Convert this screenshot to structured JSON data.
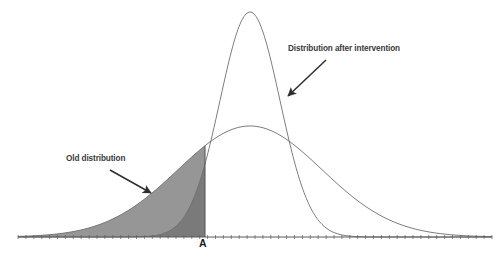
{
  "figure": {
    "width": 503,
    "height": 261,
    "background": "#ffffff"
  },
  "annotations": {
    "after_intervention_label": "Distribution after intervention",
    "old_distribution_label": "Old distribution",
    "threshold_tick_label": "A"
  },
  "colors": {
    "curve_stroke": "#6e6e6e",
    "axis_line": "#5c5c5c",
    "old_fill": "#969696",
    "overlap_fill": "#7a7a7a",
    "arrow": "#2f2f2f",
    "text": "#3a3a3a",
    "tick_label_text": "#1c1c1c"
  },
  "chart_data": {
    "type": "line",
    "title": "",
    "subtitle": "",
    "xlabel": "",
    "ylabel": "",
    "grid": false,
    "legend_position": "annotations",
    "axis": {
      "baseline_y_px": 237,
      "x_start_px": 18,
      "x_end_px": 492,
      "tick_count": 60,
      "tick_labels": [
        "A"
      ],
      "tick_label_positions_px": [
        205
      ],
      "y_axis_shown": false
    },
    "threshold": {
      "label": "A",
      "x_px": 205,
      "line_from_y_px": 147,
      "line_to_y_px": 237,
      "description": "vertical cut marking threshold A"
    },
    "series": [
      {
        "name": "Old distribution",
        "curve": "gaussian",
        "mean_px": 250,
        "sigma_px": 72,
        "peak_y_px": 126,
        "baseline_y_px": 237,
        "amplitude_px": 111,
        "stroke": "#6e6e6e",
        "fill_left_of_threshold": "#969696",
        "label": "Old distribution"
      },
      {
        "name": "Distribution after intervention",
        "curve": "gaussian",
        "mean_px": 250,
        "sigma_px": 30,
        "peak_y_px": 12,
        "baseline_y_px": 237,
        "amplitude_px": 225,
        "stroke": "#6e6e6e",
        "fill_left_of_threshold": "#7a7a7a",
        "label": "Distribution after intervention"
      }
    ],
    "annotations": [
      {
        "text": "Distribution after intervention",
        "text_x_px": 288,
        "text_y_px": 45,
        "arrow_from_px": [
          326,
          60
        ],
        "arrow_to_px": [
          288,
          96
        ]
      },
      {
        "text": "Old distribution",
        "text_x_px": 66,
        "text_y_px": 155,
        "arrow_from_px": [
          110,
          170
        ],
        "arrow_to_px": [
          151,
          193
        ]
      }
    ]
  }
}
